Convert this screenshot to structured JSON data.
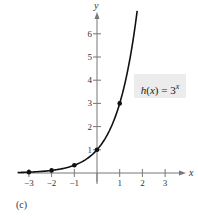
{
  "chart_data": {
    "type": "line",
    "title": "",
    "function_label": "h(x) = 3^x",
    "function_label_parts": {
      "name": "h",
      "arg": "x",
      "eq": " = 3",
      "exp": "x"
    },
    "xlabel": "x",
    "ylabel": "y",
    "xlim": [
      -3.5,
      3.5
    ],
    "ylim": [
      0,
      7
    ],
    "x_ticks": [
      -3,
      -2,
      -1,
      1,
      2,
      3
    ],
    "y_ticks": [
      1,
      2,
      3,
      4,
      5,
      6
    ],
    "x_tick_labels": [
      "−3",
      "−2",
      "−1",
      "1",
      "2",
      "3"
    ],
    "y_tick_labels": [
      "1",
      "2",
      "3",
      "4",
      "5",
      "6"
    ],
    "points": [
      {
        "x": -3,
        "y": 0.037
      },
      {
        "x": -2,
        "y": 0.111
      },
      {
        "x": -1,
        "y": 0.333
      },
      {
        "x": 0,
        "y": 1
      },
      {
        "x": 1,
        "y": 3
      }
    ],
    "series": [
      {
        "name": "h(x) = 3^x",
        "x_range": [
          -3.5,
          1.77
        ],
        "formula": "3^x"
      }
    ],
    "grid": false,
    "caption": "(c)"
  },
  "caption": "(c)"
}
